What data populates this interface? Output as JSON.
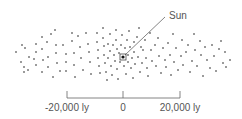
{
  "diagram": {
    "type": "scatter",
    "sun_label": "Sun",
    "sun_position": [
      123,
      57
    ],
    "label_position": [
      169,
      19
    ],
    "scale": {
      "ticks": [
        {
          "x": 67,
          "label": "-20,000 ly"
        },
        {
          "x": 123,
          "label": "0"
        },
        {
          "x": 180,
          "label": "20,000 ly"
        }
      ],
      "baseline_y": 98
    },
    "colors": {
      "dots": "#333333",
      "lines": "#666666",
      "text": "#555555"
    }
  },
  "chart_data": {
    "type": "scatter",
    "title": "",
    "annotations": [
      "Sun"
    ],
    "xaxis_ticks": [
      "-20,000 ly",
      "0",
      "20,000 ly"
    ],
    "points": [
      [
        16,
        52
      ],
      [
        22,
        45
      ],
      [
        25,
        48
      ],
      [
        21,
        62
      ],
      [
        24,
        67
      ],
      [
        24,
        72
      ],
      [
        29,
        57
      ],
      [
        28,
        70
      ],
      [
        34,
        59
      ],
      [
        36,
        44
      ],
      [
        36,
        52
      ],
      [
        36,
        65
      ],
      [
        42,
        37
      ],
      [
        42,
        49
      ],
      [
        43,
        60
      ],
      [
        42,
        72
      ],
      [
        47,
        42
      ],
      [
        48,
        57
      ],
      [
        48,
        67
      ],
      [
        51,
        34
      ],
      [
        53,
        77
      ],
      [
        55,
        30
      ],
      [
        56,
        45
      ],
      [
        56,
        53
      ],
      [
        57,
        63
      ],
      [
        60,
        71
      ],
      [
        63,
        45
      ],
      [
        66,
        54
      ],
      [
        66,
        62
      ],
      [
        66,
        71
      ],
      [
        72,
        33
      ],
      [
        72,
        41
      ],
      [
        74,
        53
      ],
      [
        74,
        65
      ],
      [
        75,
        77
      ],
      [
        78,
        36
      ],
      [
        80,
        47
      ],
      [
        81,
        58
      ],
      [
        83,
        70
      ],
      [
        86,
        33
      ],
      [
        88,
        44
      ],
      [
        89,
        52
      ],
      [
        90,
        62
      ],
      [
        91,
        74
      ],
      [
        97,
        33
      ],
      [
        97,
        42
      ],
      [
        98,
        50
      ],
      [
        98,
        58
      ],
      [
        99,
        66
      ],
      [
        100,
        73
      ],
      [
        103,
        28
      ],
      [
        103,
        38
      ],
      [
        104,
        46
      ],
      [
        104,
        55
      ],
      [
        105,
        63
      ],
      [
        106,
        72
      ],
      [
        107,
        80
      ],
      [
        108,
        44
      ],
      [
        108,
        58
      ],
      [
        110,
        34
      ],
      [
        110,
        51
      ],
      [
        111,
        66
      ],
      [
        112,
        75
      ],
      [
        113,
        45
      ],
      [
        114,
        55
      ],
      [
        115,
        61
      ],
      [
        116,
        30
      ],
      [
        116,
        40
      ],
      [
        117,
        49
      ],
      [
        117,
        69
      ],
      [
        118,
        79
      ],
      [
        119,
        53
      ],
      [
        120,
        62
      ],
      [
        121,
        45
      ],
      [
        122,
        35
      ],
      [
        124,
        66
      ],
      [
        125,
        48
      ],
      [
        126,
        74
      ],
      [
        127,
        40
      ],
      [
        128,
        55
      ],
      [
        128,
        62
      ],
      [
        129,
        31
      ],
      [
        130,
        47
      ],
      [
        131,
        68
      ],
      [
        132,
        58
      ],
      [
        133,
        78
      ],
      [
        134,
        42
      ],
      [
        134,
        52
      ],
      [
        135,
        64
      ],
      [
        137,
        37
      ],
      [
        138,
        57
      ],
      [
        139,
        28
      ],
      [
        140,
        72
      ],
      [
        141,
        47
      ],
      [
        142,
        63
      ],
      [
        143,
        50
      ],
      [
        145,
        40
      ],
      [
        146,
        58
      ],
      [
        147,
        68
      ],
      [
        148,
        76
      ],
      [
        150,
        33
      ],
      [
        151,
        50
      ],
      [
        152,
        61
      ],
      [
        155,
        45
      ],
      [
        156,
        66
      ],
      [
        158,
        38
      ],
      [
        159,
        56
      ],
      [
        161,
        73
      ],
      [
        163,
        48
      ],
      [
        165,
        60
      ],
      [
        166,
        67
      ],
      [
        168,
        43
      ],
      [
        170,
        55
      ],
      [
        171,
        75
      ],
      [
        173,
        34
      ],
      [
        174,
        62
      ],
      [
        176,
        48
      ],
      [
        178,
        70
      ],
      [
        181,
        56
      ],
      [
        182,
        40
      ],
      [
        183,
        65
      ],
      [
        186,
        52
      ],
      [
        188,
        45
      ],
      [
        190,
        72
      ],
      [
        192,
        61
      ],
      [
        194,
        34
      ],
      [
        195,
        50
      ],
      [
        197,
        66
      ],
      [
        200,
        41
      ],
      [
        201,
        55
      ],
      [
        203,
        76
      ],
      [
        205,
        47
      ],
      [
        207,
        60
      ],
      [
        210,
        68
      ],
      [
        212,
        45
      ],
      [
        214,
        56
      ],
      [
        216,
        71
      ],
      [
        219,
        49
      ],
      [
        221,
        41
      ],
      [
        223,
        63
      ],
      [
        225,
        52
      ],
      [
        226,
        67
      ],
      [
        230,
        60
      ]
    ]
  }
}
